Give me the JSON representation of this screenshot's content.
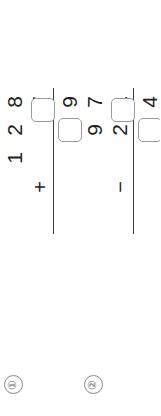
{
  "worksheet": {
    "orientation": "rotated-90-ccw",
    "background": "#ffffff",
    "ink_color": "#231f20",
    "rule_color": "#3c3c3c",
    "box_border_color": "#9a9a9a",
    "marker_color": "#6d6d6d"
  },
  "problems": [
    {
      "marker": "①",
      "marker_number": "1",
      "operator": "+",
      "operand_top": "128",
      "operand_top_digits": [
        "1",
        "2",
        "8"
      ],
      "operand_bottom": "7",
      "operand_bottom_digits": [
        "",
        "",
        "7"
      ],
      "answer_digits": [
        "",
        "9"
      ],
      "answer_known_digit": "9",
      "answer_boxes": 2,
      "row_top": [
        "1",
        "2",
        "8"
      ],
      "row_bottom_op": "+",
      "row_bottom": [
        "",
        "",
        "7"
      ],
      "row_answer": [
        "",
        "",
        "9"
      ]
    },
    {
      "marker": "②",
      "marker_number": "2",
      "operator": "−",
      "operand_top": "97",
      "operand_top_digits": [
        "",
        "9",
        "7"
      ],
      "operand_bottom": "21",
      "operand_bottom_digits": [
        "",
        "2",
        "1"
      ],
      "answer_digits": [
        "",
        "4"
      ],
      "answer_known_digit": "4",
      "answer_boxes": 2,
      "row_top": [
        "",
        "9",
        "7"
      ],
      "row_bottom_op": "−",
      "row_bottom": [
        "",
        "2",
        "1"
      ],
      "row_answer": [
        "",
        "",
        "4"
      ]
    }
  ]
}
